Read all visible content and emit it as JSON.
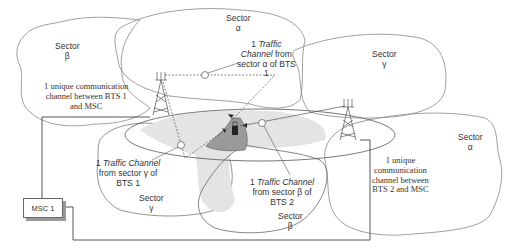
{
  "colors": {
    "outline": "#777777",
    "overlap_light": "#e4e4e4",
    "overlap_dark": "#9a9a9a",
    "line": "#555555",
    "text": "#333333"
  },
  "sectors": {
    "bts1_beta": {
      "name": "Sector",
      "symbol": "β"
    },
    "bts1_alpha": {
      "name": "Sector",
      "symbol": "α"
    },
    "bts1_gamma": {
      "name": "Sector",
      "symbol": "γ"
    },
    "bts2_gamma": {
      "name": "Sector",
      "symbol": "γ"
    },
    "bts2_alpha": {
      "name": "Sector",
      "symbol": "α"
    },
    "bts2_beta": {
      "name": "Sector",
      "symbol": "β"
    }
  },
  "annotations": {
    "bts1_msc": {
      "line1": "1 unique communication",
      "line2": "channel between BTS 1",
      "line3": "and MSC"
    },
    "bts2_msc": {
      "line1": "1 unique",
      "line2": "communication",
      "line3": "channel between",
      "line4": "BTS 2 and MSC"
    },
    "tc_alpha_bts1": {
      "num": "1",
      "italic": "Traffic",
      "italic2": "Channel",
      "rest1": "from",
      "rest2": "sector α  of BTS",
      "rest3": "1"
    },
    "tc_gamma_bts1": {
      "num": "1",
      "italic": "Traffic Channel",
      "rest1": "from sector γ of",
      "rest2": "BTS 1"
    },
    "tc_beta_bts2": {
      "num": "1",
      "italic": "Traffic Channel",
      "rest1": "from sector β  of",
      "rest2": "BTS 2"
    }
  },
  "nodes": {
    "msc": {
      "label": "MSC 1"
    },
    "bts1": {
      "label": "BTS 1"
    },
    "bts2": {
      "label": "BTS 2"
    },
    "mobile": {
      "label": "mobile station"
    }
  }
}
